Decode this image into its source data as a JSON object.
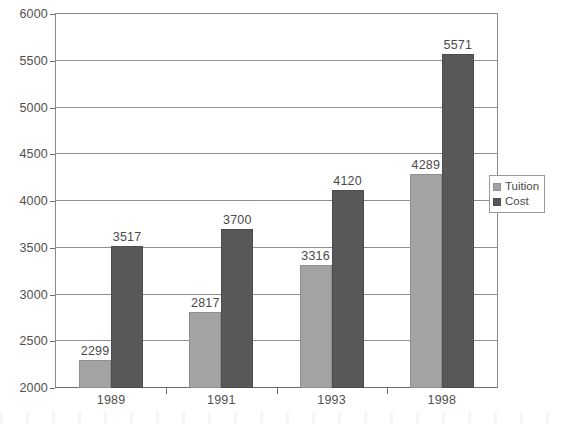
{
  "chart_data": {
    "type": "bar",
    "title": "",
    "subtitle": "",
    "xlabel": "",
    "ylabel": "",
    "categories": [
      "1989",
      "1991",
      "1993",
      "1998"
    ],
    "series": [
      {
        "name": "Tuition",
        "color": "#a3a3a3",
        "values": [
          2299,
          2817,
          3316,
          4289
        ]
      },
      {
        "name": "Cost",
        "color": "#585858",
        "values": [
          3517,
          3700,
          4120,
          5571
        ]
      }
    ],
    "ylim": [
      2000,
      6000
    ],
    "ytick_step": 500,
    "ytick_labels": [
      "2000",
      "2500",
      "3000",
      "3500",
      "4000",
      "4500",
      "5000",
      "5500",
      "6000"
    ],
    "grid": true,
    "grid_axis": "y",
    "legend_position": "right-middle",
    "data_labels": true,
    "data_label_values": [
      [
        "2299",
        "3517"
      ],
      [
        "2817",
        "3700"
      ],
      [
        "3316",
        "4120"
      ],
      [
        "4289",
        "5571"
      ]
    ],
    "annotations": []
  },
  "legend": {
    "items": [
      {
        "label": "Tuition",
        "swatch": "legend-swatch-tuition"
      },
      {
        "label": "Cost",
        "swatch": "legend-swatch-cost"
      }
    ]
  },
  "colors": {
    "tuition": "#a3a3a3",
    "cost": "#585858",
    "grid": "#8f8f8f",
    "axis": "#6d6d6d",
    "frame": "#8a8a8a",
    "text": "#4a4a4a",
    "background": "#ffffff"
  }
}
